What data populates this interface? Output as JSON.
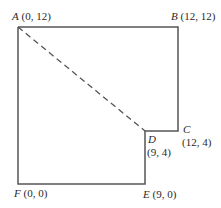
{
  "diagram": {
    "points": [
      {
        "id": "A",
        "coord": "(0, 12)"
      },
      {
        "id": "B",
        "coord": "(12, 12)"
      },
      {
        "id": "C",
        "coord": "(12, 4)"
      },
      {
        "id": "D",
        "coord": "(9, 4)"
      },
      {
        "id": "E",
        "coord": "(9, 0)"
      },
      {
        "id": "F",
        "coord": "(0, 0)"
      }
    ],
    "dashed_segment": "A-D",
    "colors": {
      "line": "#555555",
      "text": "#2a2a2a",
      "background": "#ffffff"
    }
  }
}
